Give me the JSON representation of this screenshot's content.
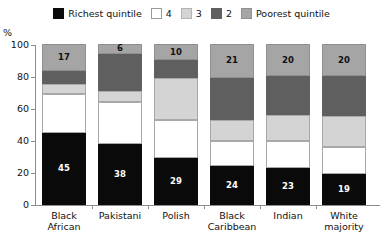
{
  "axis": {
    "y_unit": "%",
    "y_ticks": [
      "100",
      "80",
      "60",
      "40",
      "20",
      "0"
    ]
  },
  "legend": {
    "items": [
      {
        "label": "Richest quintile",
        "key": "q5",
        "color": "#0a0a0a",
        "icon": "legend-swatch"
      },
      {
        "label": "4",
        "key": "q4",
        "color": "#ffffff",
        "icon": "legend-swatch"
      },
      {
        "label": "3",
        "key": "q3",
        "color": "#d4d4d4",
        "icon": "legend-swatch"
      },
      {
        "label": "2",
        "key": "q2",
        "color": "#5f5f5f",
        "icon": "legend-swatch"
      },
      {
        "label": "Poorest quintile",
        "key": "q1",
        "color": "#a5a5a5",
        "icon": "legend-swatch"
      }
    ]
  },
  "categories_display": [
    {
      "line1": "Black",
      "line2": "African"
    },
    {
      "line1": "Pakistani",
      "line2": ""
    },
    {
      "line1": "Polish",
      "line2": ""
    },
    {
      "line1": "Black",
      "line2": "Caribbean"
    },
    {
      "line1": "Indian",
      "line2": ""
    },
    {
      "line1": "White",
      "line2": "majority"
    }
  ],
  "bars": [
    {
      "category": "Black African",
      "q5": 45,
      "q4": 24,
      "q3": 6,
      "q2": 8,
      "q1": 17,
      "labels": {
        "q5": "45",
        "q1": "17"
      }
    },
    {
      "category": "Pakistani",
      "q5": 38,
      "q4": 26,
      "q3": 7,
      "q2": 23,
      "q1": 6,
      "labels": {
        "q5": "38",
        "q1": "6"
      }
    },
    {
      "category": "Polish",
      "q5": 29,
      "q4": 24,
      "q3": 26,
      "q2": 11,
      "q1": 10,
      "labels": {
        "q5": "29",
        "q1": "10"
      }
    },
    {
      "category": "Black Caribbean",
      "q5": 24,
      "q4": 16,
      "q3": 13,
      "q2": 26,
      "q1": 21,
      "labels": {
        "q5": "24",
        "q1": "21"
      }
    },
    {
      "category": "Indian",
      "q5": 23,
      "q4": 17,
      "q3": 16,
      "q2": 24,
      "q1": 20,
      "labels": {
        "q5": "23",
        "q1": "20"
      }
    },
    {
      "category": "White majority",
      "q5": 19,
      "q4": 17,
      "q3": 19,
      "q2": 25,
      "q1": 20,
      "labels": {
        "q5": "19",
        "q1": "20"
      }
    }
  ],
  "chart_data": {
    "type": "bar",
    "subtype": "stacked-bar-100-percent",
    "title": "",
    "xlabel": "",
    "ylabel": "%",
    "ylim": [
      0,
      100
    ],
    "yticks": [
      0,
      20,
      40,
      60,
      80,
      100
    ],
    "grid": false,
    "legend_position": "top-center",
    "categories": [
      "Black African",
      "Pakistani",
      "Polish",
      "Black Caribbean",
      "Indian",
      "White majority"
    ],
    "series": [
      {
        "name": "Richest quintile",
        "color": "#0a0a0a",
        "values": [
          45,
          38,
          29,
          24,
          23,
          19
        ],
        "data_labels": [
          45,
          38,
          29,
          24,
          23,
          19
        ]
      },
      {
        "name": "4",
        "color": "#ffffff",
        "values": [
          24,
          26,
          24,
          16,
          17,
          17
        ],
        "data_labels": [
          null,
          null,
          null,
          null,
          null,
          null
        ]
      },
      {
        "name": "3",
        "color": "#d4d4d4",
        "values": [
          6,
          7,
          26,
          13,
          16,
          19
        ],
        "data_labels": [
          null,
          null,
          null,
          null,
          null,
          null
        ]
      },
      {
        "name": "2",
        "color": "#5f5f5f",
        "values": [
          8,
          23,
          11,
          26,
          24,
          25
        ],
        "data_labels": [
          null,
          null,
          null,
          null,
          null,
          null
        ]
      },
      {
        "name": "Poorest quintile",
        "color": "#a5a5a5",
        "values": [
          17,
          6,
          10,
          21,
          20,
          20
        ],
        "data_labels": [
          17,
          6,
          10,
          21,
          20,
          20
        ]
      }
    ],
    "stack_order_bottom_to_top": [
      "Richest quintile",
      "4",
      "3",
      "2",
      "Poorest quintile"
    ]
  }
}
